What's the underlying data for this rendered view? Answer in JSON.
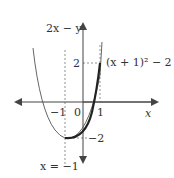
{
  "diagram": {
    "axes": {
      "x_label": "x",
      "y_label": "2x − y"
    },
    "ticks": {
      "x_neg1": "−1",
      "x_0": "0",
      "x_1": "1",
      "y_2": "2",
      "y_neg2": "−2"
    },
    "curve_label": "(x + 1)² − 2",
    "asymptote_label": "x = −1",
    "colors": {
      "axis": "#444444",
      "curve_thin": "#555555",
      "curve_bold": "#222222",
      "dashed": "#666666"
    }
  }
}
